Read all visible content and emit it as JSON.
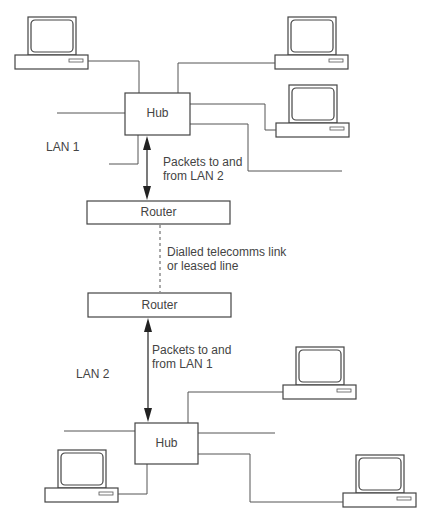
{
  "diagram": {
    "type": "network-diagram",
    "lan1": {
      "label": "LAN 1",
      "hub_label": "Hub",
      "computers": 3,
      "arrow_label_line1": "Packets to and",
      "arrow_label_line2": "from LAN 2"
    },
    "router_top": {
      "label": "Router"
    },
    "link": {
      "label_line1": "Dialled telecomms link",
      "label_line2": "or leased line",
      "style": "dashed"
    },
    "router_bottom": {
      "label": "Router"
    },
    "lan2": {
      "label": "LAN 2",
      "hub_label": "Hub",
      "computers": 3,
      "arrow_label_line1": "Packets to and",
      "arrow_label_line2": "from LAN 1"
    },
    "colors": {
      "line": "#555555",
      "text": "#444444",
      "background": "#ffffff"
    }
  }
}
